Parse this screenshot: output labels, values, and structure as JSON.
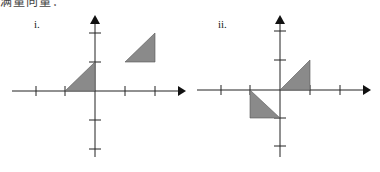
{
  "header_fragment": "满量向量：",
  "figures": [
    {
      "label": "i.",
      "axis_color": "#222222",
      "fill_color": "#8a8a8a",
      "triangles": [
        {
          "vertices": [
            [
              -1,
              0
            ],
            [
              0,
              0
            ],
            [
              0,
              1
            ]
          ]
        },
        {
          "vertices": [
            [
              1,
              1
            ],
            [
              2,
              1
            ],
            [
              2,
              2
            ]
          ]
        }
      ]
    },
    {
      "label": "ii.",
      "axis_color": "#222222",
      "fill_color": "#8a8a8a",
      "triangles": [
        {
          "vertices": [
            [
              0,
              0
            ],
            [
              1,
              0
            ],
            [
              1,
              1
            ]
          ]
        },
        {
          "vertices": [
            [
              -1,
              0
            ],
            [
              -1,
              -1
            ],
            [
              0,
              -1
            ]
          ]
        }
      ]
    }
  ]
}
